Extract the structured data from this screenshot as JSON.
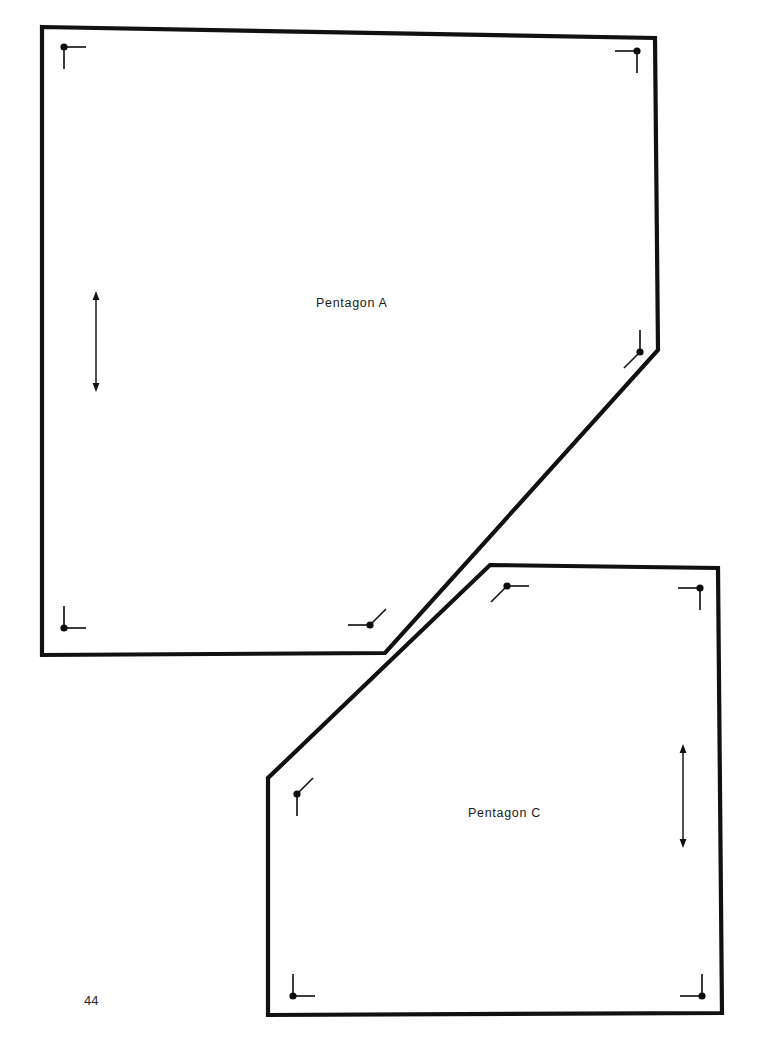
{
  "page": {
    "page_number": "44",
    "background_color": "#ffffff",
    "ink_color": "#111111",
    "width": 775,
    "height": 1061
  },
  "shapes": [
    {
      "id": "pentagon-a",
      "label": "Pentagon A",
      "label_position": {
        "x": 316,
        "y": 296
      },
      "outline_points": "42,27 655,38 658,350 385,653 42,655",
      "vertices": [
        {
          "name": "top-left",
          "x": 64,
          "y": 47,
          "ticks": [
            {
              "dx": 22,
              "dy": 0
            },
            {
              "dx": 0,
              "dy": 22
            }
          ]
        },
        {
          "name": "top-right",
          "x": 637,
          "y": 51,
          "ticks": [
            {
              "dx": -22,
              "dy": 0
            },
            {
              "dx": 0,
              "dy": 22
            }
          ]
        },
        {
          "name": "right-lower",
          "x": 640,
          "y": 352,
          "ticks": [
            {
              "dx": 0,
              "dy": -22
            },
            {
              "dx": -16,
              "dy": 16
            }
          ]
        },
        {
          "name": "bottom-right",
          "x": 370,
          "y": 625,
          "ticks": [
            {
              "dx": -22,
              "dy": 0
            },
            {
              "dx": 16,
              "dy": -16
            }
          ]
        },
        {
          "name": "bottom-left",
          "x": 64,
          "y": 628,
          "ticks": [
            {
              "dx": 0,
              "dy": -22
            },
            {
              "dx": 22,
              "dy": 0
            }
          ]
        }
      ],
      "dimension_arrow": {
        "name": "height-arrow",
        "x": 96,
        "y_top": 291,
        "y_bottom": 392,
        "double_headed": true
      }
    },
    {
      "id": "pentagon-c",
      "label": "Pentagon C",
      "label_position": {
        "x": 468,
        "y": 806
      },
      "outline_points": "490,565 718,568 722,1013 268,1015 268,778",
      "vertices": [
        {
          "name": "top-left",
          "x": 507,
          "y": 586,
          "ticks": [
            {
              "dx": 22,
              "dy": 0
            },
            {
              "dx": -16,
              "dy": 16
            }
          ]
        },
        {
          "name": "top-right",
          "x": 700,
          "y": 588,
          "ticks": [
            {
              "dx": -22,
              "dy": 0
            },
            {
              "dx": 0,
              "dy": 22
            }
          ]
        },
        {
          "name": "bottom-right",
          "x": 702,
          "y": 996,
          "ticks": [
            {
              "dx": 0,
              "dy": -22
            },
            {
              "dx": -22,
              "dy": 0
            }
          ]
        },
        {
          "name": "bottom-left",
          "x": 293,
          "y": 996,
          "ticks": [
            {
              "dx": 0,
              "dy": -22
            },
            {
              "dx": 22,
              "dy": 0
            }
          ]
        },
        {
          "name": "left-upper",
          "x": 297,
          "y": 794,
          "ticks": [
            {
              "dx": 0,
              "dy": 22
            },
            {
              "dx": 16,
              "dy": -16
            }
          ]
        }
      ],
      "dimension_arrow": {
        "name": "height-arrow",
        "x": 683,
        "y_top": 744,
        "y_bottom": 848,
        "double_headed": true
      }
    }
  ]
}
